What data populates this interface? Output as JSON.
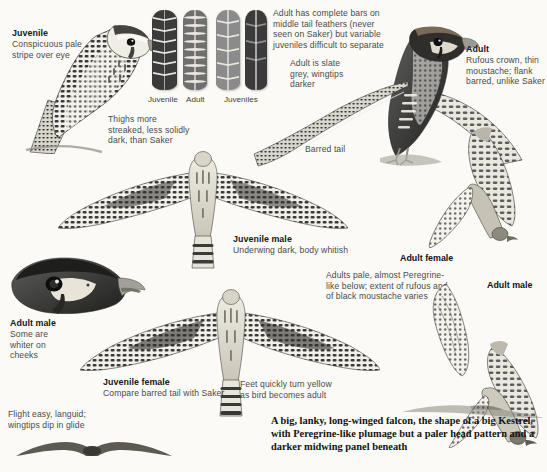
{
  "plate": {
    "background": "#fbfaf6",
    "ink": "#4a4a48",
    "heading_ink": "#17171a"
  },
  "captions": {
    "juvenile_perched": {
      "heading": "Juvenile",
      "body": "Conspicuous pale\nstripe over eye"
    },
    "thighs": {
      "heading": "",
      "body": "Thighs more\nstreaked, less solidly\ndark, than Saker"
    },
    "adult_tail": {
      "heading": "",
      "body": "Adult has complete bars on\nmiddle tail feathers (never\nseen on Saker) but variable\njuveniles difficult to separate"
    },
    "adult_slate": {
      "heading": "",
      "body": "Adult is slate\ngrey, wingtips\ndarker"
    },
    "barred_tail": {
      "heading": "",
      "body": "Barred tail"
    },
    "adult_perched": {
      "heading": "Adult",
      "body": "Rufous crown, thin\nmoustache; flank\nbarred, unlike Saker"
    },
    "juvenile_male": {
      "heading": "Juvenile male",
      "body": "Underwing dark, body whitish"
    },
    "adult_female": {
      "heading": "Adult female",
      "body": ""
    },
    "adults_pale": {
      "heading": "",
      "body": "Adults pale, almost Peregrine-\nlike below; extent of rufous and\nof black moustache varies"
    },
    "adult_male_flight": {
      "heading": "Adult male",
      "body": ""
    },
    "adult_male_head": {
      "heading": "Adult male",
      "body": "Some are\nwhiter on\ncheeks"
    },
    "juvenile_female": {
      "heading": "Juvenile female",
      "body": "Compare barred tail with Saker"
    },
    "feet": {
      "heading": "",
      "body": "Feet quickly turn yellow\nas bird becomes adult"
    },
    "flight": {
      "heading": "",
      "body": "Flight easy, languid;\nwingtips dip in glide"
    }
  },
  "feather_labels": [
    {
      "label": "Juvenile"
    },
    {
      "label": "Adult"
    },
    {
      "label": "Juveniles"
    }
  ],
  "summary": {
    "text": "A big, lanky, long-winged falcon, the shape of a big Kestrel, with Peregrine-like plumage but a paler head pattern and a darker midwing panel beneath"
  },
  "figures": [
    {
      "name": "juvenile-perched-bird"
    },
    {
      "name": "tail-feather-swatches"
    },
    {
      "name": "adult-perched-bird"
    },
    {
      "name": "juvenile-male-flight-underside"
    },
    {
      "name": "adult-female-flight-upperside"
    },
    {
      "name": "adult-male-head-portrait"
    },
    {
      "name": "juvenile-female-flight-underside"
    },
    {
      "name": "adult-male-flight-side"
    },
    {
      "name": "gliding-silhouette"
    },
    {
      "name": "top-flight-silhouette"
    }
  ]
}
